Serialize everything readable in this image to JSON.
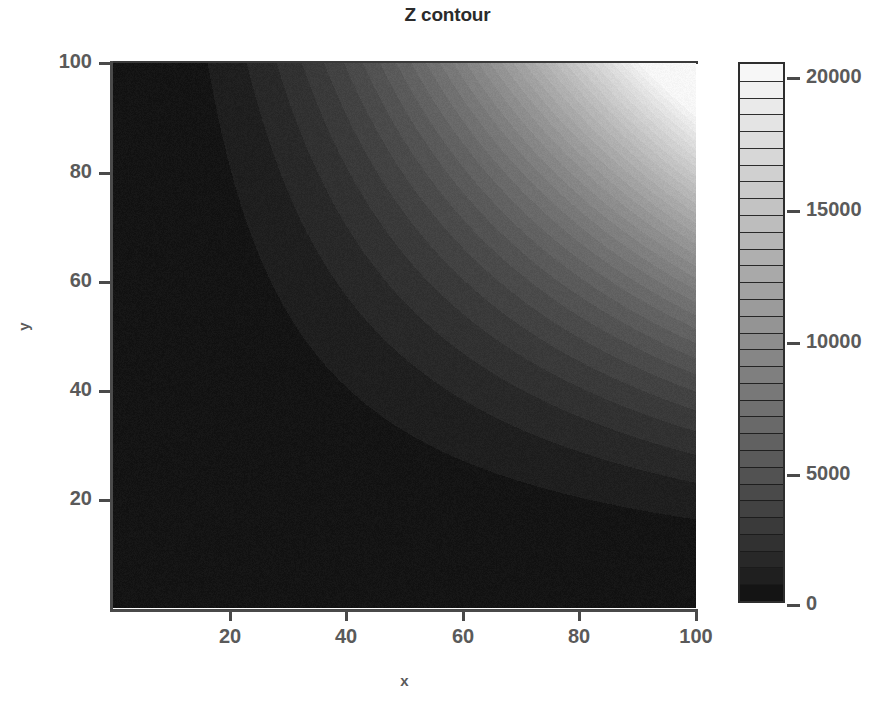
{
  "chart_data": {
    "type": "heatmap",
    "title": "Z contour",
    "xlabel": "x",
    "ylabel": "y",
    "xlim": [
      0,
      100
    ],
    "ylim": [
      0,
      100
    ],
    "zlim": [
      0,
      21000
    ],
    "x_ticks": [
      20,
      40,
      60,
      80,
      100
    ],
    "y_ticks": [
      20,
      40,
      60,
      80,
      100
    ],
    "colorbar": {
      "ticks": [
        0,
        5000,
        10000,
        15000,
        20000
      ],
      "tick_labels": [
        "0",
        "5000",
        "10000",
        "15000",
        "20000"
      ],
      "bands": 32,
      "colormap": "grayscale",
      "min_color": "#0d0d0d",
      "max_color": "#fafafa",
      "orientation": "vertical",
      "position": "right"
    },
    "grid": false,
    "legend": false,
    "surface_note": "z rises steeply toward the top-right corner; iso-contours are curved (hyperbola-like), dark over most of the domain",
    "corner_values": {
      "bottom_left": 0,
      "bottom_right": 1800,
      "top_left": 1800,
      "top_right": 21000
    },
    "sample_grid": {
      "x": [
        0,
        20,
        40,
        60,
        80,
        100
      ],
      "y": [
        0,
        20,
        40,
        60,
        80,
        100
      ],
      "z": [
        [
          0,
          10,
          40,
          90,
          160,
          250
        ],
        [
          10,
          180,
          700,
          1580,
          2810,
          4390
        ],
        [
          40,
          700,
          2800,
          6300,
          11200,
          17500
        ],
        [
          90,
          1580,
          6300,
          14100,
          25200,
          21000
        ],
        [
          160,
          2810,
          11200,
          25200,
          21000,
          21000
        ],
        [
          250,
          4390,
          17500,
          21000,
          21000,
          21000
        ]
      ]
    }
  },
  "plot": {
    "title": "Z contour",
    "x_axis": {
      "label": "x",
      "tick_labels": [
        "20",
        "40",
        "60",
        "80",
        "100"
      ]
    },
    "y_axis": {
      "label": "y",
      "tick_labels": [
        "20",
        "40",
        "60",
        "80",
        "100"
      ]
    },
    "colorbar_labels": [
      "20000",
      "15000",
      "10000",
      "5000",
      "0"
    ]
  }
}
